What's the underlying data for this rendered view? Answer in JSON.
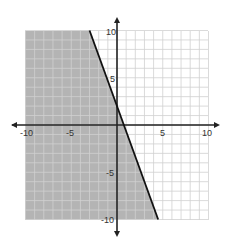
{
  "chart_data": {
    "type": "line",
    "title": "",
    "xlabel": "",
    "ylabel": "",
    "xlim": [
      -10,
      10
    ],
    "ylim": [
      -10,
      10
    ],
    "grid": true,
    "grid_step": 1,
    "x_tick_labels": [
      "-10",
      "-5",
      "5",
      "10"
    ],
    "y_tick_labels": [
      "10",
      "5",
      "-5",
      "-10"
    ],
    "boundary_line": {
      "equation": "y = -8/3 x + 2",
      "slope": -2.6667,
      "y_intercept": 2,
      "x_intercept": 0.75,
      "style": "solid",
      "points": [
        [
          -3,
          10
        ],
        [
          4.5,
          -10
        ]
      ]
    },
    "shaded_region": "left of line (y <= -8/3 x + 2)",
    "colors": {
      "shade": "#b4b4b4",
      "grid": "#d0d0d0",
      "axis": "#222222",
      "line": "#111111"
    }
  }
}
